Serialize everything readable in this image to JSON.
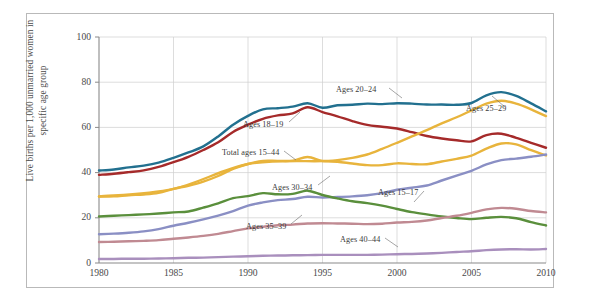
{
  "chart_data": {
    "type": "line",
    "title": "",
    "subtitle": "",
    "xlabel": "",
    "ylabel": "Live births per 1,000 unmarried women in specific age group",
    "xlim": [
      1980,
      2010
    ],
    "ylim": [
      0,
      100
    ],
    "grid": true,
    "legend_position": "inline-annotations",
    "xticks": [
      "1980",
      "1985",
      "1990",
      "1995",
      "2000",
      "2005",
      "2010"
    ],
    "xtick_values": [
      1980,
      1985,
      1990,
      1995,
      2000,
      2005,
      2010
    ],
    "yticks": [
      "0",
      "20",
      "40",
      "60",
      "80",
      "100"
    ],
    "ytick_values": [
      0,
      20,
      40,
      60,
      80,
      100
    ],
    "x": [
      1980,
      1981,
      1982,
      1983,
      1984,
      1985,
      1986,
      1987,
      1988,
      1989,
      1990,
      1991,
      1992,
      1993,
      1994,
      1995,
      1996,
      1997,
      1998,
      1999,
      2000,
      2001,
      2002,
      2003,
      2004,
      2005,
      2006,
      2007,
      2008,
      2009,
      2010
    ],
    "series": [
      {
        "name": "Ages 20-24",
        "label": "Ages 20–24",
        "color": "#22708f",
        "values": [
          40.9,
          41.4,
          42.3,
          43.1,
          44.4,
          46.5,
          48.9,
          51.6,
          56.0,
          61.2,
          65.1,
          68.0,
          68.5,
          69.2,
          70.7,
          68.7,
          69.8,
          70.0,
          70.5,
          70.3,
          70.7,
          70.5,
          70.1,
          70.1,
          70.0,
          70.8,
          74.2,
          75.6,
          73.9,
          70.6,
          67.1
        ],
        "annotation": {
          "text": "Ages 20–24",
          "x_px": 336,
          "y_px": 85
        }
      },
      {
        "name": "Ages 18-19",
        "label": "Ages 18–19",
        "color": "#a52a2a",
        "values": [
          39.0,
          39.5,
          40.2,
          41.0,
          42.5,
          44.6,
          47.0,
          50.0,
          53.4,
          58.0,
          61.2,
          63.8,
          65.3,
          66.2,
          68.9,
          66.8,
          64.9,
          62.8,
          61.1,
          60.3,
          59.5,
          57.9,
          56.2,
          55.1,
          54.3,
          53.8,
          56.6,
          57.2,
          55.4,
          53.2,
          51.0
        ],
        "annotation": {
          "text": "Ages 18–19",
          "x_px": 243,
          "y_px": 120
        }
      },
      {
        "name": "Total ages 15-44",
        "label": "Total ages 15–44",
        "color": "#e8b43c",
        "values": [
          29.4,
          29.5,
          30.0,
          30.3,
          31.0,
          32.8,
          34.2,
          36.0,
          38.5,
          41.6,
          43.8,
          45.2,
          45.2,
          45.3,
          46.9,
          45.1,
          44.8,
          44.0,
          43.3,
          43.3,
          44.1,
          43.8,
          43.7,
          44.9,
          46.1,
          47.5,
          50.6,
          52.9,
          52.5,
          49.9,
          47.6
        ],
        "annotation": {
          "text": "Total ages 15–44",
          "x_px": 222,
          "y_px": 148
        }
      },
      {
        "name": "Ages 25-29",
        "label": "Ages 25–29",
        "color": "#e8b43c",
        "note": "same gold stroke, upper right branch",
        "values": [
          null,
          null,
          null,
          null,
          null,
          null,
          null,
          null,
          null,
          null,
          null,
          null,
          null,
          null,
          null,
          null,
          null,
          null,
          null,
          null,
          null,
          null,
          null,
          null,
          null,
          null,
          null,
          null,
          null,
          null,
          null
        ],
        "annotation": {
          "text": "Ages 25–29",
          "x_px": 466,
          "y_px": 104
        }
      },
      {
        "name": "Ages 30-34",
        "label": "Ages 30–34",
        "color": "#8a8fc4",
        "values": [
          12.7,
          13.0,
          13.4,
          14.0,
          15.0,
          16.5,
          17.8,
          19.3,
          21.0,
          23.0,
          25.4,
          26.8,
          27.8,
          28.3,
          29.3,
          29.0,
          29.2,
          29.5,
          30.0,
          30.9,
          32.4,
          33.3,
          34.3,
          36.5,
          38.7,
          40.8,
          43.6,
          45.5,
          46.2,
          47.0,
          48.0
        ],
        "annotation": {
          "text": "Ages 30–34",
          "x_px": 272,
          "y_px": 183
        }
      },
      {
        "name": "Ages 15-17",
        "label": "Ages 15–17",
        "color": "#5a8f3c",
        "values": [
          20.6,
          20.9,
          21.2,
          21.5,
          21.9,
          22.4,
          22.8,
          24.5,
          26.4,
          28.7,
          29.6,
          30.9,
          30.4,
          30.6,
          32.0,
          30.1,
          28.6,
          27.3,
          26.5,
          25.4,
          23.9,
          22.5,
          21.5,
          20.6,
          19.9,
          19.4,
          20.0,
          20.4,
          19.8,
          18.1,
          16.6
        ],
        "annotation": {
          "text": "Ages 15–17",
          "x_px": 378,
          "y_px": 188
        }
      },
      {
        "name": "Ages 35-39",
        "label": "Ages 35–39",
        "color": "#c08a92",
        "values": [
          9.3,
          9.4,
          9.6,
          9.8,
          10.1,
          10.7,
          11.3,
          12.0,
          12.9,
          14.1,
          15.3,
          16.0,
          16.7,
          17.0,
          17.5,
          17.6,
          17.5,
          17.4,
          17.2,
          17.4,
          17.9,
          18.2,
          18.8,
          19.9,
          20.9,
          22.2,
          23.7,
          24.4,
          24.0,
          23.0,
          22.4
        ],
        "annotation": {
          "text": "Ages 35–39",
          "x_px": 246,
          "y_px": 222
        }
      },
      {
        "name": "Ages 40-44",
        "label": "Ages 40–44",
        "color": "#a98fbd",
        "values": [
          1.8,
          1.8,
          1.9,
          1.9,
          2.0,
          2.1,
          2.3,
          2.4,
          2.6,
          2.8,
          3.0,
          3.2,
          3.3,
          3.4,
          3.5,
          3.6,
          3.6,
          3.6,
          3.6,
          3.7,
          3.9,
          4.0,
          4.2,
          4.5,
          4.9,
          5.2,
          5.7,
          6.0,
          6.1,
          6.0,
          6.2
        ],
        "annotation": {
          "text": "Ages 40–44",
          "x_px": 340,
          "y_px": 235
        }
      }
    ],
    "series_secondary": [
      {
        "name": "Ages 25-29 line",
        "color": "#e8b43c",
        "x": [
          1980,
          1985,
          1990,
          1995,
          1996,
          1997,
          1998,
          1999,
          2000,
          2001,
          2002,
          2003,
          2004,
          2005,
          2006,
          2007,
          2008,
          2009,
          2010
        ],
        "values": [
          29.4,
          32.8,
          43.8,
          45.1,
          45.5,
          46.5,
          48.0,
          50.5,
          53.2,
          56.0,
          58.8,
          61.8,
          64.5,
          67.5,
          70.5,
          71.8,
          70.5,
          68.0,
          65.0
        ]
      }
    ]
  },
  "axis": {
    "ylabel_line1": "Live births per 1,000 unmarried women in",
    "ylabel_line2": "specific age group"
  }
}
